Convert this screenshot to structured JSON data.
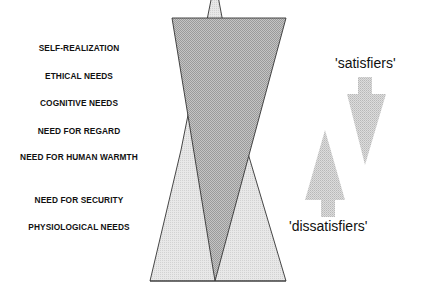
{
  "needs": [
    "SELF-REALIZATION",
    "ETHICAL NEEDS",
    "COGNITIVE NEEDS",
    "NEED FOR REGARD",
    "NEED FOR HUMAN WARMTH",
    "NEED FOR SECURITY",
    "PHYSIOLOGICAL NEEDS"
  ],
  "satisfiers_label": "'satisfiers'",
  "dissatisfiers_label": "'dissatisfiers'",
  "colors": {
    "dark_fill": "#a8a8a8",
    "light_fill": "#dedede",
    "arrow_fill": "#cccccc",
    "stroke": "#333333"
  }
}
